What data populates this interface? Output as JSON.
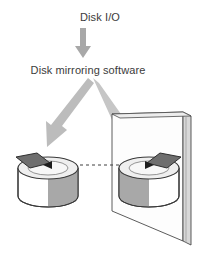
{
  "diagram": {
    "title_label": "Disk I/O",
    "software_label": "Disk mirroring software",
    "colors": {
      "background": "#ffffff",
      "text": "#3b3b3b",
      "arrow_gray": "#b4b4b4",
      "arrow_gray_dark": "#a2a2a2",
      "outline": "#3a3a3a",
      "cylinder_light": "#ffffff",
      "cylinder_shade": "#a8a8a8",
      "cylinder_top": "#ececec",
      "head_arm": "#6e6e6e",
      "mirror_glass": "#fdfdfd",
      "mirror_edge": "#c9c9c9",
      "dash_line": "#4a4a4a"
    },
    "nodes": [
      {
        "name": "disk-io-source",
        "label": "Disk I/O"
      },
      {
        "name": "mirroring-software",
        "label": "Disk mirroring software"
      },
      {
        "name": "primary-disk",
        "label": ""
      },
      {
        "name": "mirrored-disk",
        "label": ""
      },
      {
        "name": "mirror-panel",
        "label": ""
      }
    ],
    "connectors": [
      {
        "name": "io-to-software-arrow",
        "kind": "arrow",
        "direction": "down"
      },
      {
        "name": "software-to-primary-disk-arrow",
        "kind": "arrow",
        "direction": "down-left"
      },
      {
        "name": "software-to-mirrored-disk-arrow",
        "kind": "arrow",
        "direction": "down-right"
      },
      {
        "name": "disk-to-disk-mirror-line",
        "kind": "dashed-line",
        "direction": "horizontal"
      }
    ]
  }
}
